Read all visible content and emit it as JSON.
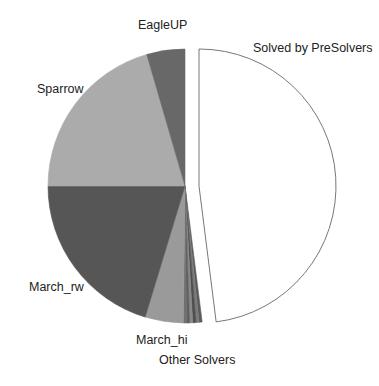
{
  "chart_data": {
    "type": "pie",
    "title": "",
    "start_angle_deg": 0,
    "direction": "clockwise",
    "center": [
      185,
      186
    ],
    "radius": 137,
    "slices": [
      {
        "label": "Solved by PreSolvers",
        "value": 48.0,
        "color": "#ffffff",
        "stroke": "#777777",
        "explode": [
          14,
          0
        ]
      },
      {
        "label": "Other Solvers",
        "value": 2.2,
        "color": "#6a6a6a",
        "sub_slices": 6
      },
      {
        "label": "March_hi",
        "value": 4.5,
        "color": "#9a9a9a"
      },
      {
        "label": "March_rw",
        "value": 20.3,
        "color": "#565656"
      },
      {
        "label": "Sparrow",
        "value": 20.5,
        "color": "#ababab"
      },
      {
        "label": "EagleUP",
        "value": 4.5,
        "color": "#686868"
      }
    ],
    "legend": "none",
    "label_positions": {
      "EagleUP": [
        138,
        18
      ],
      "Solved by PreSolvers": [
        253,
        41
      ],
      "Sparrow": [
        37,
        82
      ],
      "March_rw": [
        29,
        280
      ],
      "March_hi": [
        136,
        333
      ],
      "Other Solvers": [
        159,
        353
      ]
    }
  },
  "labels": {
    "eagleup": "EagleUP",
    "presolvers": "Solved by PreSolvers",
    "sparrow": "Sparrow",
    "march_rw": "March_rw",
    "march_hi": "March_hi",
    "other": "Other Solvers"
  }
}
